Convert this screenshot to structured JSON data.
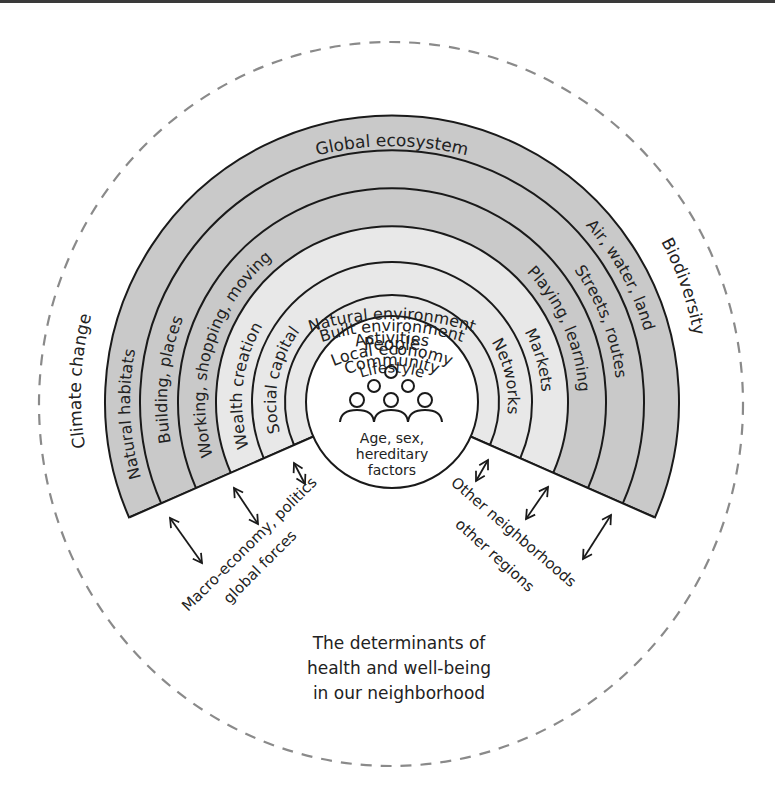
{
  "caption_lines": [
    "The determinants of",
    "health and well-being",
    "in our neighborhood"
  ],
  "colors": {
    "outer_rings": "#c9c9c9",
    "inner_rings": "#e8e8e8",
    "people_circle": "#ffffff",
    "stroke": "#1a1a1a",
    "dashed_circle": "#8a8a8a"
  },
  "outer_context": {
    "top": "Global ecosystem",
    "left": "Climate change",
    "right": "Biodiversity"
  },
  "rings": [
    {
      "name": "Natural environment",
      "left": "Natural habitats",
      "right": "Air, water, land",
      "shade": "outer"
    },
    {
      "name": "Built environment",
      "left": "Building, places",
      "right": "Streets, routes",
      "shade": "outer"
    },
    {
      "name": "Activities",
      "left": "Working, shopping, moving",
      "right": "Playing, learning",
      "shade": "outer"
    },
    {
      "name": "Local economy",
      "left": "Wealth creation",
      "right": "Markets",
      "shade": "inner"
    },
    {
      "name": "Community",
      "left": "Social capital",
      "right": "Networks",
      "shade": "inner"
    },
    {
      "name": "Lifestyle",
      "left": "",
      "right": "",
      "shade": "inner"
    }
  ],
  "center": {
    "title": "People",
    "icon": "group-of-people-icon",
    "lines": [
      "Age, sex,",
      "hereditary",
      "factors"
    ]
  },
  "external_forces": {
    "left_lines": [
      "Macro-economy, politics",
      "global forces"
    ],
    "right_lines": [
      "Other neighborhoods",
      "other regions"
    ]
  },
  "arrows": {
    "left_count": 3,
    "right_count": 3,
    "type": "double-headed"
  }
}
